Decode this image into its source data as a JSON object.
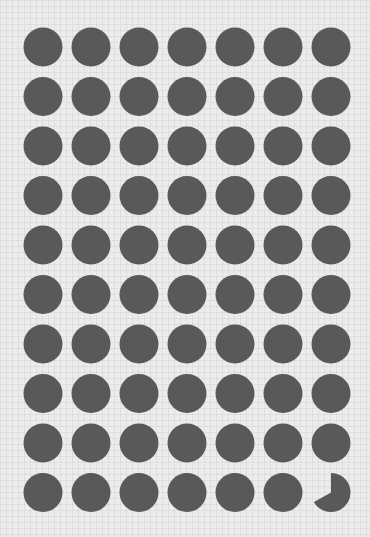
{
  "chart_data": {
    "type": "waffle",
    "title": "",
    "rows": 10,
    "columns": 7,
    "total_units": 70,
    "full_units": 69,
    "partial_unit_fraction": 0.67,
    "value": 69.67,
    "unit_shape": "circle",
    "fill_color": "#595959",
    "background_color": "#ececec",
    "legend": [],
    "xlabel": "",
    "ylabel": ""
  },
  "layout": {
    "first_center_x": 43,
    "first_center_y": 47,
    "col_spacing": 48,
    "row_spacing": 49.5,
    "radius": 19.5
  }
}
